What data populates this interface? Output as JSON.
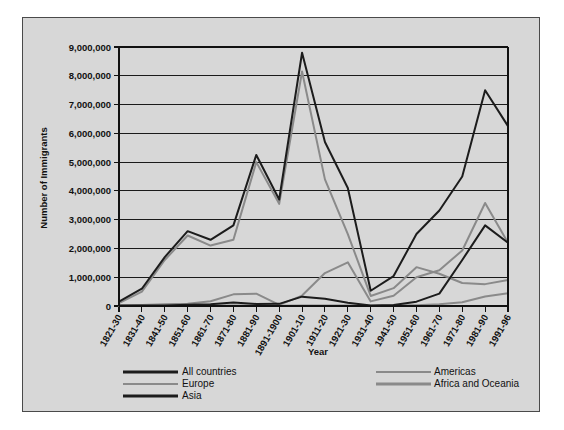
{
  "chart_data": {
    "type": "line",
    "title": "",
    "xlabel": "Year",
    "ylabel": "Number of Immigrants",
    "ylim": [
      0,
      9000000
    ],
    "ytick_labels": [
      "9,000,000",
      "8,000,000",
      "7,000,000",
      "6,000,000",
      "5,000,000",
      "4,000,000",
      "3,000,000",
      "2,000,000",
      "1,000,000",
      "0"
    ],
    "ytick_values": [
      9000000,
      8000000,
      7000000,
      6000000,
      5000000,
      4000000,
      3000000,
      2000000,
      1000000,
      0
    ],
    "grid": true,
    "legend_position": "bottom",
    "categories": [
      "1821-30",
      "1831-40",
      "1841-50",
      "1851-60",
      "1861-70",
      "1871-80",
      "1881-90",
      "1891-1900",
      "1901-10",
      "1911-20",
      "1921-30",
      "1931-40",
      "1941-50",
      "1951-60",
      "1961-70",
      "1971-80",
      "1981-90",
      "1991-96"
    ],
    "series": [
      {
        "name": "All countries",
        "color": "#1c1c1c",
        "width": 2.0,
        "values": [
          150000,
          600000,
          1700000,
          2600000,
          2300000,
          2800000,
          5250000,
          3700000,
          8800000,
          5700000,
          4100000,
          530000,
          1040000,
          2500000,
          3320000,
          4500000,
          7500000,
          6250000
        ]
      },
      {
        "name": "Europe",
        "color": "#8a8a8a",
        "width": 2.0,
        "values": [
          100000,
          500000,
          1600000,
          2450000,
          2100000,
          2300000,
          5000000,
          3550000,
          8150000,
          4400000,
          2500000,
          350000,
          620000,
          1350000,
          1120000,
          800000,
          760000,
          900000
        ]
      },
      {
        "name": "Asia",
        "color": "#1c1c1c",
        "width": 2.0,
        "values": [
          20000,
          20000,
          20000,
          40000,
          65000,
          125000,
          70000,
          75000,
          325000,
          250000,
          110000,
          20000,
          35000,
          150000,
          430000,
          1600000,
          2800000,
          2200000
        ]
      },
      {
        "name": "Americas",
        "color": "#8a8a8a",
        "width": 2.0,
        "values": [
          12000,
          33000,
          62000,
          75000,
          167000,
          404000,
          427000,
          39000,
          362000,
          1144000,
          1517000,
          160000,
          355000,
          997000,
          1240000,
          1930000,
          3580000,
          2200000
        ]
      },
      {
        "name": "Africa and Oceania",
        "color": "#8a8a8a",
        "width": 2.0,
        "values": [
          5000,
          5000,
          5000,
          8000,
          15000,
          16000,
          20000,
          10000,
          20000,
          20000,
          20000,
          10000,
          15000,
          30000,
          60000,
          130000,
          330000,
          440000
        ]
      }
    ]
  },
  "legend": {
    "entries": [
      {
        "label": "All countries",
        "color": "#1c1c1c",
        "width": 3.0
      },
      {
        "label": "Europe",
        "color": "#8a8a8a",
        "width": 2.0
      },
      {
        "label": "Asia",
        "color": "#1c1c1c",
        "width": 3.0
      },
      {
        "label": "Americas",
        "color": "#8a8a8a",
        "width": 2.2
      },
      {
        "label": "Africa and Oceania",
        "color": "#8a8a8a",
        "width": 2.8
      }
    ]
  }
}
